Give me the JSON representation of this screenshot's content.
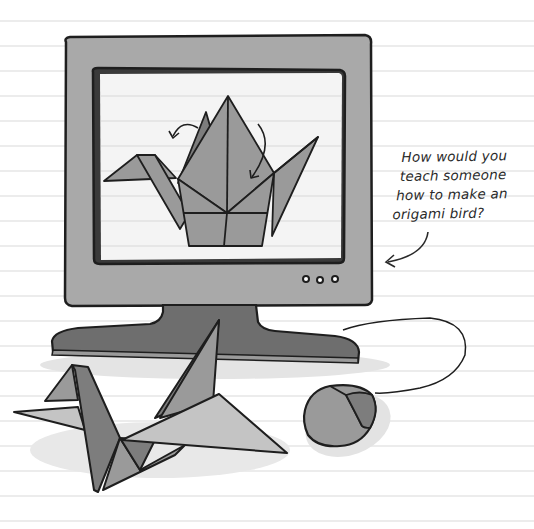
{
  "illustration": {
    "subject": "Computer monitor displaying an origami crane diagram, with a folded origami crane and a mouse on a ruled notebook page",
    "monitor": {
      "screen_content": "origami-crane-diagram",
      "buttons_count": 3
    },
    "annotation": {
      "lines": [
        "How would you",
        "teach someone",
        "how to make an",
        "origami bird?"
      ]
    },
    "colors": {
      "paper": "#ffffff",
      "rule_line": "#ececec",
      "monitor_body": "#a9a9a9",
      "screen": "#f4f4f4",
      "stand": "#6e6e6e",
      "outline": "#1e1e1e",
      "crane_dark": "#7d7d7d",
      "crane_mid": "#9a9a9a",
      "crane_light": "#c4c4c4"
    }
  }
}
